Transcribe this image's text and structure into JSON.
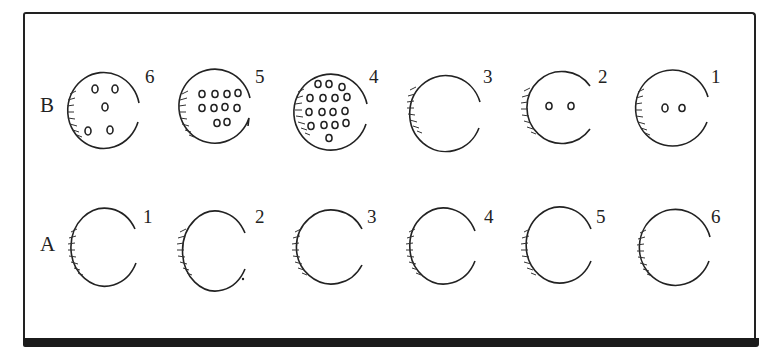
{
  "figure": {
    "rows": [
      {
        "label": "B",
        "items": [
          {
            "number": "6",
            "holes": 5
          },
          {
            "number": "5",
            "holes": 10
          },
          {
            "number": "4",
            "holes": 17
          },
          {
            "number": "3",
            "holes": 0
          },
          {
            "number": "2",
            "holes": 2
          },
          {
            "number": "1",
            "holes": 2
          }
        ]
      },
      {
        "label": "A",
        "items": [
          {
            "number": "1",
            "holes": 0
          },
          {
            "number": "2",
            "holes": 0
          },
          {
            "number": "3",
            "holes": 0
          },
          {
            "number": "4",
            "holes": 0
          },
          {
            "number": "5",
            "holes": 0
          },
          {
            "number": "6",
            "holes": 0
          }
        ]
      }
    ],
    "colors": {
      "ink": "#222222",
      "background": "#ffffff"
    }
  }
}
